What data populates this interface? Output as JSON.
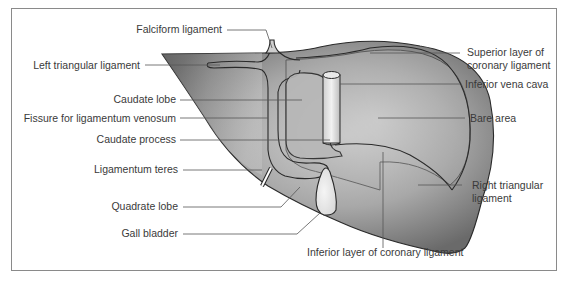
{
  "figure": {
    "colors": {
      "frame": "#8a8a8a",
      "liver_dark": "#6e6e6e",
      "liver_mid": "#9c9c9c",
      "liver_light": "#d9d9d9",
      "bare_area": "#bdbdbd",
      "gall_bladder": "#ececec",
      "leader": "#555555",
      "label_text": "#3a3a3a"
    }
  },
  "labels": {
    "falciform_ligament": "Falciform ligament",
    "left_triangular_ligament": "Left triangular ligament",
    "caudate_lobe": "Caudate lobe",
    "fissure_ligamentum_venosum": "Fissure for ligamentum venosum",
    "caudate_process": "Caudate process",
    "ligamentum_teres": "Ligamentum teres",
    "quadrate_lobe": "Quadrate lobe",
    "gall_bladder": "Gall bladder",
    "superior_coronary_line1": "Superior layer of",
    "superior_coronary_line2": "coronary ligament",
    "inferior_vena_cava": "Inferior vena cava",
    "bare_area": "Bare area",
    "right_triangular_line1": "Right triangular",
    "right_triangular_line2": "ligament",
    "inferior_coronary": "Inferior layer of coronary ligament"
  }
}
